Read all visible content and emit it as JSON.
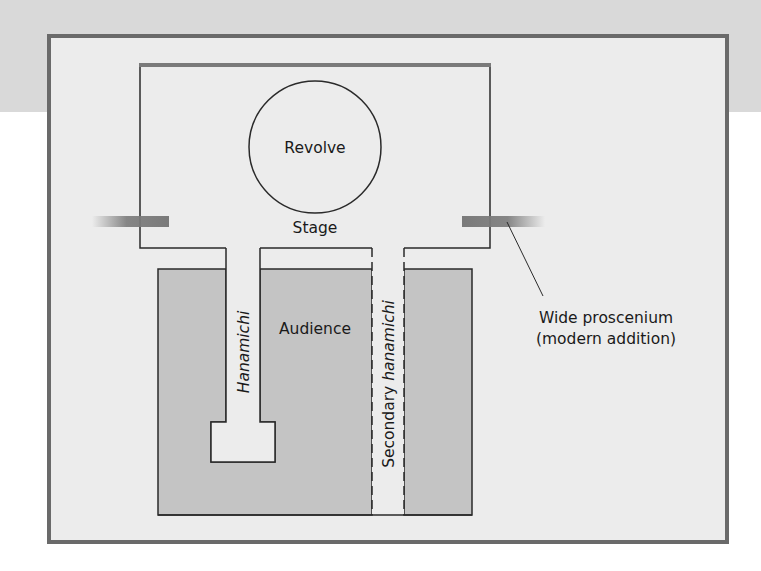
{
  "diagram": {
    "labels": {
      "revolve": "Revolve",
      "stage": "Stage",
      "audience": "Audience",
      "hanamichi": "Hanamichi",
      "secondary_prefix": "Secondary ",
      "secondary_italic": "hanamichi",
      "proscenium_line1": "Wide proscenium",
      "proscenium_line2": "(modern addition)"
    },
    "colors": {
      "header_band": "#d9d9d9",
      "frame_fill": "#ececec",
      "frame_border": "#6a6a6a",
      "audience_fill": "#c4c4c4",
      "stage_fill": "#ececec",
      "line": "#2a2a2a",
      "proscenium_bar": "#7a7a7a"
    },
    "elements": [
      {
        "id": "stage",
        "type": "region",
        "label": "Stage"
      },
      {
        "id": "revolve",
        "type": "circle",
        "label": "Revolve",
        "parent": "stage"
      },
      {
        "id": "hanamichi",
        "type": "walkway",
        "label": "Hanamichi",
        "connects": [
          "stage",
          "audience"
        ]
      },
      {
        "id": "secondary-hanamichi",
        "type": "walkway",
        "label": "Secondary hanamichi",
        "style": "dashed"
      },
      {
        "id": "audience",
        "type": "region",
        "label": "Audience"
      },
      {
        "id": "proscenium",
        "type": "bars",
        "label": "Wide proscenium (modern addition)"
      }
    ]
  }
}
